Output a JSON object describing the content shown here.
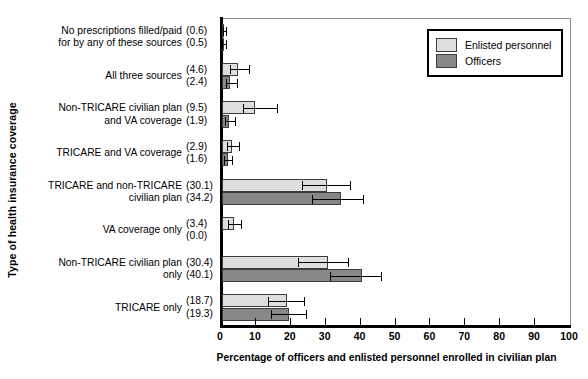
{
  "chart_data": {
    "type": "bar",
    "orientation": "horizontal",
    "title": "",
    "xlabel": "Percentage of officers and enlisted personnel enrolled in civilian plan",
    "ylabel": "Type of health insurance coverage",
    "xlim": [
      0,
      100
    ],
    "xticks": [
      0,
      10,
      20,
      30,
      40,
      50,
      60,
      70,
      80,
      90,
      100
    ],
    "grid": false,
    "legend_position": "top-right",
    "categories": [
      "No prescriptions filled/paid\nfor by any of these sources",
      "All three sources",
      "Non-TRICARE civilian plan\nand VA coverage",
      "TRICARE and VA coverage",
      "TRICARE and non-TRICARE\ncivilian plan",
      "VA coverage only",
      "Non-TRICARE civilian plan\nonly",
      "TRICARE only"
    ],
    "series": [
      {
        "name": "Enlisted personnel",
        "color": "#dedede",
        "values": [
          0.6,
          4.6,
          9.5,
          2.9,
          30.1,
          3.4,
          30.4,
          18.7
        ],
        "errors_low": [
          0.4,
          2.2,
          3.4,
          1.4,
          7.1,
          1.7,
          8.6,
          5.6
        ],
        "errors_high": [
          0.6,
          3.1,
          6.2,
          2.0,
          6.6,
          2.1,
          5.8,
          4.9
        ]
      },
      {
        "name": "Officers",
        "color": "#878787",
        "values": [
          0.5,
          2.4,
          1.9,
          1.6,
          34.2,
          0.0,
          40.1,
          19.3
        ],
        "errors_low": [
          0.4,
          1.2,
          1.1,
          0.9,
          8.4,
          0.0,
          9.1,
          5.4
        ],
        "errors_high": [
          0.6,
          2.0,
          1.9,
          1.4,
          6.3,
          0.0,
          5.6,
          4.7
        ]
      }
    ],
    "value_labels": [
      {
        "enlisted": "(0.6)",
        "officers": "(0.5)"
      },
      {
        "enlisted": "(4.6)",
        "officers": "(2.4)"
      },
      {
        "enlisted": "(9.5)",
        "officers": "(1.9)"
      },
      {
        "enlisted": "(2.9)",
        "officers": "(1.6)"
      },
      {
        "enlisted": "(30.1)",
        "officers": "(34.2)"
      },
      {
        "enlisted": "(3.4)",
        "officers": "(0.0)"
      },
      {
        "enlisted": "(30.4)",
        "officers": "(40.1)"
      },
      {
        "enlisted": "(18.7)",
        "officers": "(19.3)"
      }
    ]
  },
  "legend": {
    "items": [
      {
        "label": "Enlisted personnel"
      },
      {
        "label": "Officers"
      }
    ]
  }
}
